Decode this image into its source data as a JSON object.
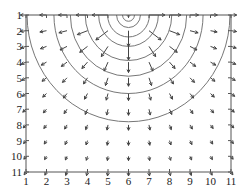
{
  "chart_data": {
    "type": "quiver-contour",
    "title": "",
    "xlabel": "",
    "ylabel": "",
    "xlim": [
      1,
      11
    ],
    "ylim": [
      1,
      11
    ],
    "y_axis_reversed": true,
    "grid": false,
    "x_ticks": [
      "1",
      "2",
      "3",
      "4",
      "5",
      "6",
      "7",
      "8",
      "9",
      "10",
      "11"
    ],
    "y_ticks": [
      "1",
      "2",
      "3",
      "4",
      "5",
      "6",
      "7",
      "8",
      "9",
      "10",
      "11"
    ],
    "source_point": [
      6,
      1
    ],
    "vector_field": {
      "description": "Arrows on 11x11 grid point radially outward from (6,1), magnitude decreasing with distance",
      "grid_x": [
        1,
        2,
        3,
        4,
        5,
        6,
        7,
        8,
        9,
        10,
        11
      ],
      "grid_y": [
        1,
        2,
        3,
        4,
        5,
        6,
        7,
        8,
        9,
        10,
        11
      ]
    },
    "contours": {
      "description": "Concentric semicircular contour lines centered at (6,1)",
      "center_column_crossings_y": [
        1.1,
        1.4,
        1.8,
        2.4,
        3.0,
        3.9,
        4.9,
        6.0,
        7.8
      ]
    }
  }
}
